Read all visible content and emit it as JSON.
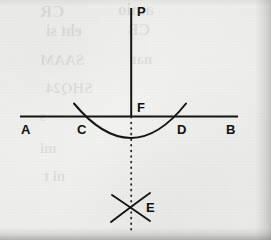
{
  "figure": {
    "ink_color": "#111111",
    "paper_color": "#ececea",
    "labels": {
      "a": "A",
      "b": "B",
      "c": "C",
      "d": "D",
      "e": "E",
      "f": "F",
      "p": "P"
    },
    "elements": {
      "baseline_name": "line-AB",
      "vertical_name": "line-PF",
      "arc_name": "arc-CD",
      "dotted_name": "dotted-line-FE",
      "cross_name": "cross-mark-E"
    }
  }
}
